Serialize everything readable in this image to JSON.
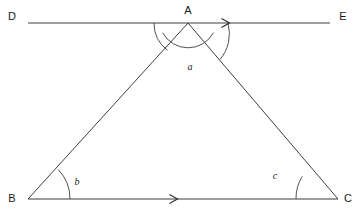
{
  "figure": {
    "type": "geometry-diagram",
    "background_color": "#ffffff",
    "stroke_color": "#3d3d3d",
    "label_color": "#1a1a1a"
  },
  "points": {
    "A": {
      "label": "A",
      "x": 188,
      "y": 23,
      "label_x": 188,
      "label_y": 11
    },
    "B": {
      "label": "B",
      "x": 28,
      "y": 199,
      "label_x": 12,
      "label_y": 199
    },
    "C": {
      "label": "C",
      "x": 338,
      "y": 199,
      "label_x": 348,
      "label_y": 199
    },
    "D": {
      "label": "D",
      "x": 28,
      "y": 23,
      "label_x": 12,
      "label_y": 17
    },
    "E": {
      "label": "E",
      "x": 330,
      "y": 23,
      "label_x": 343,
      "label_y": 17
    }
  },
  "segments": [
    {
      "name": "line-DE",
      "from": "D",
      "to": "E",
      "x1": 28,
      "y1": 23,
      "x2": 330,
      "y2": 23
    },
    {
      "name": "side-AB",
      "from": "A",
      "to": "B",
      "x1": 188,
      "y1": 23,
      "x2": 28,
      "y2": 199
    },
    {
      "name": "side-AC",
      "from": "A",
      "to": "C",
      "x1": 188,
      "y1": 23,
      "x2": 338,
      "y2": 199
    },
    {
      "name": "side-BC",
      "from": "B",
      "to": "C",
      "x1": 28,
      "y1": 199,
      "x2": 338,
      "y2": 199
    }
  ],
  "arrow_marks": [
    {
      "name": "arrow-on-DE",
      "x": 228,
      "y": 23,
      "direction": "right"
    },
    {
      "name": "arrow-on-BC",
      "x": 176,
      "y": 199,
      "direction": "right"
    }
  ],
  "angles": [
    {
      "name": "angle-a",
      "label": "a",
      "vertex": "A",
      "label_x": 190,
      "label_y": 68,
      "arc_radius": 29,
      "arc_path": "M 162.6 32.7 A 29 29 0 0 0 213.5 32.7"
    },
    {
      "name": "angle-b",
      "label": "b",
      "vertex": "B",
      "label_x": 77,
      "label_y": 183,
      "arc_radius": 42,
      "arc_path": "M 70 199 A 42 42 0 0 0 58.2 169.5"
    },
    {
      "name": "angle-c",
      "label": "c",
      "vertex": "C",
      "label_x": 275,
      "label_y": 177,
      "arc_radius": 42,
      "arc_path": "M 296 199 A 42 42 0 0 1 302.2 176.4"
    },
    {
      "name": "angle-DAB",
      "label": "",
      "vertex": "A",
      "arc_radius": 34,
      "arc_path": "M 154 23 A 34 34 0 0 0 167.5 50.3"
    },
    {
      "name": "angle-CAE",
      "label": "",
      "vertex": "A",
      "arc_radius": 40,
      "arc_path": "M 219.9 59.6 A 40 40 0 0 0 228 23"
    }
  ]
}
